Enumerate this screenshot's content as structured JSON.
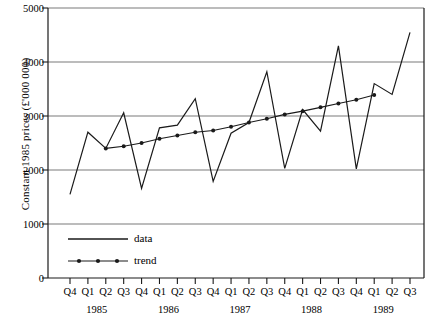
{
  "chart_data": {
    "type": "line",
    "title": "",
    "xlabel": "",
    "ylabel": "Constant 1985 prices (£'000 000)",
    "ylim": [
      0,
      5000
    ],
    "yticks": [
      0,
      1000,
      2000,
      3000,
      4000,
      5000
    ],
    "ytick_labels": [
      "0",
      "1000",
      "2000",
      "3000",
      "4000",
      "5000"
    ],
    "grid": true,
    "legend_position": "lower-left-inside",
    "categories": [
      "Q4",
      "Q1",
      "Q2",
      "Q3",
      "Q4",
      "Q1",
      "Q2",
      "Q3",
      "Q4",
      "Q1",
      "Q2",
      "Q3",
      "Q4",
      "Q1",
      "Q2",
      "Q3",
      "Q4",
      "Q1",
      "Q2",
      "Q3"
    ],
    "year_groups": [
      {
        "label": "1985",
        "start_index": 0,
        "end_index": 3
      },
      {
        "label": "1986",
        "start_index": 4,
        "end_index": 7
      },
      {
        "label": "1987",
        "start_index": 8,
        "end_index": 11
      },
      {
        "label": "1988",
        "start_index": 12,
        "end_index": 15
      },
      {
        "label": "1989",
        "start_index": 16,
        "end_index": 19
      }
    ],
    "series": [
      {
        "name": "data",
        "marker": "none",
        "values": [
          1550,
          2700,
          2400,
          3060,
          1660,
          2780,
          2830,
          3320,
          1790,
          2680,
          2880,
          3820,
          2030,
          3120,
          2720,
          4300,
          2020,
          3600,
          3400,
          4550
        ]
      },
      {
        "name": "trend",
        "marker": "dot",
        "values": [
          null,
          null,
          2400,
          2440,
          2500,
          2580,
          2640,
          2700,
          2730,
          2800,
          2880,
          2950,
          3030,
          3090,
          3160,
          3230,
          3300,
          3390,
          null,
          null
        ]
      }
    ],
    "legend": [
      {
        "label": "data",
        "style": "line"
      },
      {
        "label": "trend",
        "style": "line-with-markers"
      }
    ],
    "colors": {
      "line": "#1a1a1a",
      "grid": "#7a7a7a",
      "axis": "#1a1a1a",
      "background": "#ffffff"
    }
  }
}
